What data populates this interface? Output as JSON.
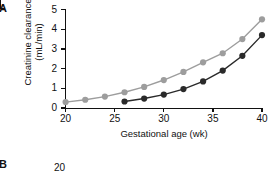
{
  "panels": {
    "a_label": "A",
    "b_label": "B"
  },
  "chart_data": {
    "type": "line",
    "title": "",
    "xlabel": "Gestational age (wk)",
    "ylabel": "Creatinine clearance (mL/min)",
    "ylabel_line1": "Creatinine clearance",
    "ylabel_line2": "(mL/min)",
    "xlim": [
      20,
      40
    ],
    "ylim": [
      0,
      5
    ],
    "xticks": [
      20,
      25,
      30,
      35,
      40
    ],
    "yticks": [
      0,
      1,
      2,
      3,
      4,
      5
    ],
    "grid": false,
    "legend": "none",
    "colors": {
      "series_light": "#9d9d9d",
      "series_dark": "#2a2a2a",
      "axis": "#111111"
    },
    "series": [
      {
        "name": "upper-light-gray",
        "color": "#9d9d9d",
        "x": [
          20,
          22,
          24,
          26,
          28,
          30,
          32,
          34,
          36,
          38,
          40
        ],
        "values": [
          0.3,
          0.42,
          0.58,
          0.8,
          1.07,
          1.42,
          1.83,
          2.32,
          2.78,
          3.5,
          4.5
        ]
      },
      {
        "name": "lower-dark",
        "color": "#2a2a2a",
        "x": [
          26,
          28,
          30,
          32,
          34,
          36,
          38,
          40
        ],
        "values": [
          0.33,
          0.48,
          0.68,
          0.96,
          1.35,
          1.9,
          2.65,
          3.7
        ]
      }
    ]
  },
  "panel_b": {
    "ytick_top": "20"
  }
}
